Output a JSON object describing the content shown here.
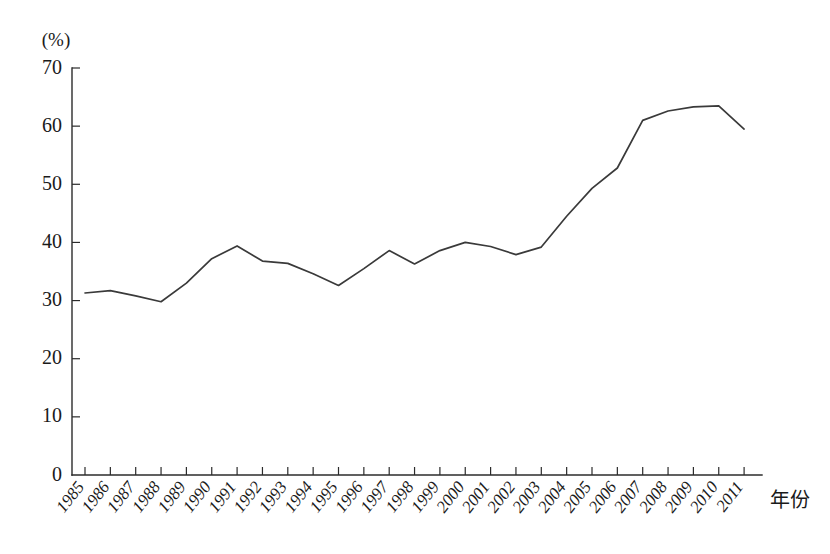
{
  "chart_data": {
    "type": "line",
    "title": "",
    "subtitle": "",
    "xlabel": "年份",
    "ylabel": "(%)",
    "unit_label": "(%)",
    "grid": false,
    "legend": "none",
    "xlim": [
      1985,
      2011
    ],
    "ylim": [
      0,
      70
    ],
    "ytick_labels": [
      "0",
      "10",
      "20",
      "30",
      "40",
      "50",
      "60",
      "70"
    ],
    "ytick_values": [
      0,
      10,
      20,
      30,
      40,
      50,
      60,
      70
    ],
    "categories": [
      "1985",
      "1986",
      "1987",
      "1988",
      "1989",
      "1990",
      "1991",
      "1992",
      "1993",
      "1994",
      "1995",
      "1996",
      "1997",
      "1998",
      "1999",
      "2000",
      "2001",
      "2002",
      "2003",
      "2004",
      "2005",
      "2006",
      "2007",
      "2008",
      "2009",
      "2010",
      "2011"
    ],
    "series": [
      {
        "name": "",
        "color": "#3a3a3a",
        "values": [
          31.3,
          31.7,
          30.8,
          29.8,
          33.0,
          37.2,
          39.4,
          36.8,
          36.4,
          34.6,
          32.6,
          35.5,
          38.6,
          36.3,
          38.6,
          40.0,
          39.3,
          37.9,
          39.2,
          44.5,
          49.3,
          52.8,
          61.0,
          62.6,
          63.3,
          63.5,
          59.5
        ]
      }
    ]
  }
}
